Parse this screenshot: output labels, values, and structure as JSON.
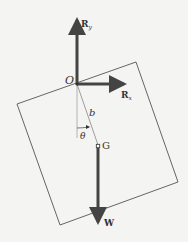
{
  "diagram": {
    "type": "free-body diagram",
    "colors": {
      "background": "#f4f4f2",
      "plate_outline": "#555555",
      "vector": "#444444",
      "text": "#333333"
    },
    "labels": {
      "pivot": "O",
      "center_of_mass": "G",
      "distance": "b",
      "angle": "θ",
      "reaction_y": {
        "main": "R",
        "sub": "y"
      },
      "reaction_x": {
        "main": "R",
        "sub": "x"
      },
      "weight": "W"
    }
  }
}
